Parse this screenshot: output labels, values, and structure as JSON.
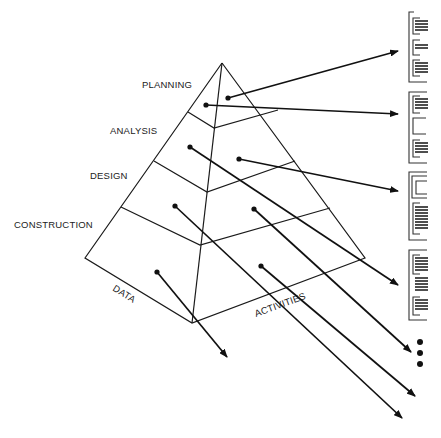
{
  "diagram": {
    "type": "pyramid-to-documents",
    "levels": [
      {
        "label": "PLANNING"
      },
      {
        "label": "ANALYSIS"
      },
      {
        "label": "DESIGN"
      },
      {
        "label": "CONSTRUCTION"
      }
    ],
    "faces": {
      "left": "DATA",
      "right": "ACTIVITIES"
    },
    "documents_count": 4,
    "continuation": "vertical-ellipsis",
    "colors": {
      "line": "#1a1a1a",
      "background": "#ffffff"
    }
  }
}
